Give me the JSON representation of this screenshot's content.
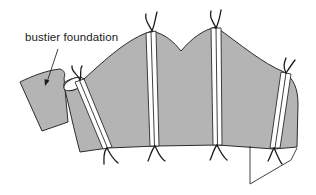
{
  "figure": {
    "type": "sewing-pattern-illustration",
    "labels": [
      {
        "text": "bustier foundation",
        "x": 25,
        "y": 31
      }
    ],
    "colors": {
      "fabric_fill": "#b4b4b4",
      "outline": "#2b2b2b",
      "channel_fill": "#ffffff",
      "background": "#ffffff"
    },
    "boning_channels": 4
  }
}
